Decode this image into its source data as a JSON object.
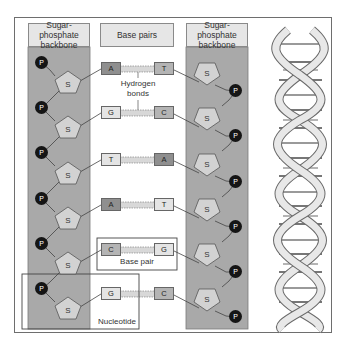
{
  "diagram": {
    "title_left": "Sugar-phosphate backbone",
    "title_center": "Base pairs",
    "title_right": "Sugar-phosphate backbone",
    "hydrogen_bonds_label": "Hydrogen bonds",
    "base_pair_label": "Base pair",
    "nucleotide_label": "Nucleotide",
    "phosphate_symbol": "P",
    "sugar_symbol": "S",
    "pairs": [
      {
        "left": "A",
        "right": "T",
        "left_shade": "dark",
        "right_shade": "mid"
      },
      {
        "left": "G",
        "right": "C",
        "left_shade": "light",
        "right_shade": "mid"
      },
      {
        "left": "T",
        "right": "A",
        "left_shade": "light",
        "right_shade": "dark"
      },
      {
        "left": "A",
        "right": "T",
        "left_shade": "dark",
        "right_shade": "light"
      },
      {
        "left": "C",
        "right": "G",
        "left_shade": "mid",
        "right_shade": "light"
      },
      {
        "left": "G",
        "right": "C",
        "left_shade": "light",
        "right_shade": "mid"
      }
    ],
    "colors": {
      "backbone_fill": "#a9a9a9",
      "header_fill": "#e6e6e6",
      "phosphate": "#151515",
      "sugar": "#d2d2d2",
      "helix_ribbon": "#e8e8e8",
      "frame": "#6e6e6e"
    }
  }
}
